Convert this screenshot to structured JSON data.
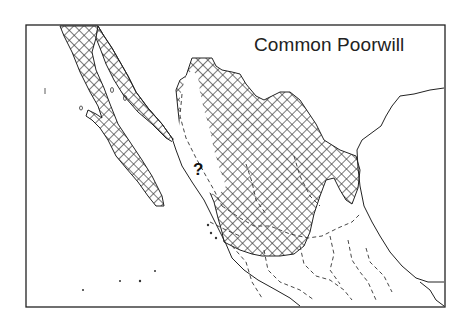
{
  "map": {
    "title": "Common Poorwill",
    "unknown_marker": "?",
    "colors": {
      "border": "#222222",
      "coastline": "#222222",
      "hatch": "#333333",
      "background": "#ffffff"
    },
    "legend": {
      "range_pattern": "cross-hatch",
      "state_borders": "dashed"
    }
  }
}
